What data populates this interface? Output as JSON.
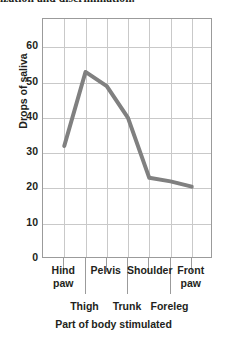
{
  "page": {
    "cut_off_header_text": "ization and discrimination."
  },
  "chart_data": {
    "type": "line",
    "title": "",
    "xlabel": "Part of body stimulated",
    "ylabel": "Drops of saliva",
    "categories": [
      "Hind\npaw",
      "Thigh",
      "Pelvis",
      "Trunk",
      "Shoulder",
      "Foreleg",
      "Front\npaw"
    ],
    "category_rows": [
      "upper",
      "lower",
      "upper",
      "lower",
      "upper",
      "lower",
      "upper"
    ],
    "values": [
      32,
      53,
      49,
      40,
      23,
      22,
      20.5
    ],
    "ylim": [
      0,
      68
    ],
    "ytick_values": [
      0,
      10,
      20,
      30,
      40,
      50,
      60
    ],
    "ytick_labels": [
      "0",
      "10",
      "20",
      "30",
      "40",
      "50",
      "60"
    ],
    "grid": true,
    "legend": "none",
    "line_color": "#808080",
    "grid_color": "#c9c9c9",
    "frame_color": "#9b9b9b"
  }
}
